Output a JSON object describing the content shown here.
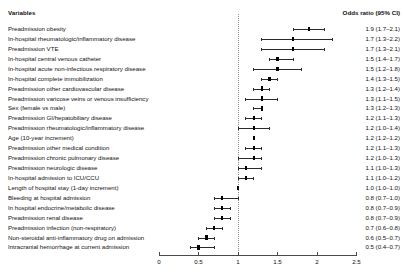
{
  "header": {
    "variables_label": "Variables",
    "odds_label": "Odds ratio (95% CI)"
  },
  "axis": {
    "ticks": [
      "0",
      "0.5",
      "1",
      "1.5",
      "2",
      "2.5"
    ],
    "tick_values": [
      0,
      0.5,
      1,
      1.5,
      2,
      2.5
    ],
    "reference_value": 1
  },
  "colors": {
    "marker": "#000000",
    "ci": "#2b2b2b",
    "refline": "#8a8a8a",
    "axis": "#4a4a4a",
    "text": "#111111"
  },
  "chart_data": {
    "type": "scatter",
    "title": "",
    "subtitle": "",
    "xlabel": "",
    "ylabel": "",
    "xlim": [
      0,
      2.5
    ],
    "grid": false,
    "legend": "none",
    "reference_line": 1,
    "columns": [
      "Variables",
      "Odds ratio (95% CI)"
    ],
    "categories": [
      "Preadmission obesity",
      "In-hospital rheumatologic/inflammatory disease",
      "Preadmission VTE",
      "In-hospital central venous catheter",
      "In-hospital acute non-infectious respiratory disease",
      "In-hospital complete immobilization",
      "Preadmission other cardiovascular disease",
      "Preadmission varicose veins or venous insufficiency",
      "Sex (female vs male)",
      "Preadmission GI/hepatobiliary disease",
      "Preadmission rheumatologic/inflammatory disease",
      "Age (10-year increment)",
      "Preadmission other medical condition",
      "Preadmission chronic pulmonary disease",
      "Preadmission neurologic disease",
      "In-hospital admission to ICU/CCU",
      "Length of hospital stay (1-day increment)",
      "Bleeding at hospital admission",
      "In hospital endocrine/metabolic disease",
      "Preadmission renal disease",
      "Preadmission infection (non-respiratory)",
      "Non-steroidal anti-inflammatory drug on admission",
      "Intracranial hemorrhage at current admission"
    ],
    "values": [
      1.9,
      1.7,
      1.7,
      1.5,
      1.5,
      1.4,
      1.3,
      1.3,
      1.3,
      1.2,
      1.2,
      1.2,
      1.2,
      1.2,
      1.1,
      1.1,
      1.0,
      0.8,
      0.8,
      0.8,
      0.7,
      0.6,
      0.5
    ],
    "ci_low": [
      1.7,
      1.3,
      1.3,
      1.4,
      1.2,
      1.3,
      1.2,
      1.1,
      1.2,
      1.1,
      1.0,
      1.2,
      1.1,
      1.0,
      1.0,
      1.0,
      1.0,
      0.7,
      0.7,
      0.7,
      0.6,
      0.5,
      0.4
    ],
    "ci_high": [
      2.1,
      2.2,
      2.1,
      1.7,
      1.8,
      1.5,
      1.4,
      1.5,
      1.3,
      1.3,
      1.4,
      1.2,
      1.3,
      1.3,
      1.3,
      1.2,
      1.0,
      1.0,
      0.9,
      0.9,
      0.8,
      0.7,
      0.7
    ],
    "labels": [
      "1.9 (1.7–2.1)",
      "1.7 (1.3–2.2)",
      "1.7 (1.3–2.1)",
      "1.5 (1.4–1.7)",
      "1.5 (1.2–1.8)",
      "1.4 (1.3–1.5)",
      "1.3 (1.2–1.4)",
      "1.3 (1.1–1.5)",
      "1.3 (1.2–1.3)",
      "1.2 (1.1–1.3)",
      "1.2 (1.0–1.4)",
      "1.2 (1.2–1.2)",
      "1.2 (1.1–1.3)",
      "1.2 (1.0–1.3)",
      "1.1 (1.0–1.3)",
      "1.1 (1.0–1.2)",
      "1.0 (1.0–1.0)",
      "0.8 (0.7–1.0)",
      "0.8 (0.7–0.9)",
      "0.8 (0.7–0.9)",
      "0.7 (0.6–0.8)",
      "0.6 (0.5–0.7)",
      "0.5 (0.4–0.7)"
    ]
  }
}
